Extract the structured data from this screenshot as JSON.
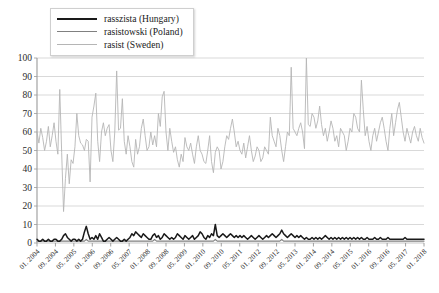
{
  "chart_data": {
    "type": "line",
    "title": "",
    "xlabel": "",
    "ylabel": "",
    "ylim": [
      0,
      100
    ],
    "yticks": [
      0,
      10,
      20,
      30,
      40,
      50,
      60,
      70,
      80,
      90,
      100
    ],
    "ytick_labels": [
      "0",
      "10",
      "20",
      "30",
      "40",
      "50",
      "60",
      "70",
      "80",
      "90",
      "100"
    ],
    "grid": true,
    "legend_position": "top-left",
    "x_tick_labels": [
      "01. 2004",
      "09. 2004",
      "05. 2005",
      "01. 2006",
      "09. 2006",
      "05. 2007",
      "01. 2008",
      "09. 2008",
      "05. 2009",
      "01. 2010",
      "09. 2010",
      "05. 2011",
      "01. 2012",
      "09. 2012",
      "05. 2013",
      "01. 2014",
      "09. 2014",
      "05. 2015",
      "01. 2016",
      "09. 2016",
      "05. 2017",
      "01. 2018"
    ],
    "x_start": "01. 2004",
    "x_end": "01. 2018",
    "series": [
      {
        "name": "rasszista (Hungary)",
        "color": "#1a1a1a",
        "values": [
          2,
          1,
          1,
          2,
          1,
          1,
          2,
          1,
          1,
          2,
          2,
          1,
          1,
          2,
          4,
          5,
          3,
          2,
          1,
          2,
          2,
          1,
          2,
          1,
          2,
          6,
          9,
          5,
          2,
          3,
          2,
          4,
          2,
          5,
          3,
          1,
          1,
          2,
          3,
          2,
          1,
          2,
          3,
          2,
          1,
          1,
          2,
          1,
          2,
          3,
          5,
          4,
          6,
          5,
          4,
          3,
          5,
          4,
          3,
          2,
          2,
          4,
          5,
          3,
          4,
          2,
          3,
          5,
          4,
          3,
          2,
          3,
          2,
          3,
          5,
          4,
          3,
          2,
          4,
          3,
          2,
          3,
          4,
          2,
          3,
          4,
          6,
          5,
          3,
          2,
          4,
          3,
          5,
          4,
          10,
          4,
          3,
          4,
          5,
          4,
          3,
          4,
          5,
          4,
          3,
          4,
          3,
          4,
          3,
          4,
          3,
          2,
          3,
          4,
          3,
          2,
          3,
          4,
          3,
          2,
          3,
          4,
          3,
          4,
          5,
          4,
          3,
          4,
          5,
          7,
          5,
          4,
          3,
          4,
          5,
          4,
          3,
          4,
          3,
          4,
          3,
          2,
          3,
          2,
          2,
          3,
          2,
          3,
          2,
          3,
          2,
          3,
          4,
          3,
          2,
          3,
          2,
          3,
          2,
          3,
          2,
          3,
          2,
          3,
          2,
          3,
          2,
          3,
          2,
          3,
          2,
          3,
          2,
          2,
          3,
          2,
          2,
          2,
          3,
          2,
          2,
          3,
          2,
          2,
          2,
          3,
          2,
          2,
          2,
          2,
          2,
          2,
          2,
          2,
          3,
          2,
          2,
          2,
          2,
          2,
          2,
          2,
          2,
          2,
          2
        ]
      },
      {
        "name": "rasistowski (Poland)",
        "color": "#808080",
        "values": [
          1,
          1,
          1,
          1,
          1,
          1,
          1,
          1,
          1,
          1,
          1,
          1,
          1,
          1,
          1,
          1,
          1,
          1,
          1,
          1,
          1,
          1,
          1,
          1,
          1,
          1,
          2,
          1,
          1,
          1,
          1,
          1,
          1,
          1,
          1,
          1,
          1,
          1,
          1,
          1,
          1,
          1,
          1,
          1,
          1,
          1,
          1,
          1,
          1,
          1,
          1,
          1,
          1,
          1,
          1,
          1,
          1,
          1,
          1,
          1,
          1,
          1,
          2,
          1,
          1,
          1,
          1,
          1,
          1,
          1,
          1,
          1,
          1,
          1,
          1,
          1,
          1,
          1,
          1,
          1,
          1,
          1,
          1,
          1,
          1,
          1,
          1,
          1,
          1,
          1,
          1,
          1,
          1,
          1,
          2,
          1,
          1,
          1,
          1,
          1,
          1,
          1,
          1,
          1,
          1,
          1,
          1,
          1,
          1,
          1,
          1,
          1,
          1,
          1,
          1,
          1,
          1,
          1,
          1,
          1,
          1,
          1,
          1,
          1,
          1,
          1,
          1,
          1,
          1,
          2,
          1,
          1,
          1,
          1,
          1,
          1,
          1,
          1,
          1,
          1,
          1,
          1,
          1,
          1,
          1,
          1,
          1,
          1,
          1,
          1,
          1,
          1,
          1,
          1,
          1,
          1,
          1,
          1,
          1,
          1,
          1,
          1,
          1,
          1,
          1,
          1,
          1,
          1,
          1,
          1,
          1,
          1,
          1,
          1,
          1,
          1,
          1,
          1,
          1,
          1,
          1,
          1,
          1,
          1,
          1,
          1,
          1,
          1,
          1,
          1,
          1,
          1,
          1,
          1,
          1,
          1,
          1,
          1,
          1,
          1,
          1,
          1,
          1,
          1,
          1
        ]
      },
      {
        "name": "rasist (Sweden)",
        "color": "#b5b5b5",
        "values": [
          60,
          54,
          62,
          57,
          50,
          55,
          63,
          52,
          58,
          65,
          55,
          48,
          83,
          49,
          17,
          35,
          48,
          32,
          45,
          43,
          52,
          70,
          58,
          54,
          53,
          50,
          56,
          55,
          33,
          68,
          74,
          81,
          55,
          44,
          60,
          65,
          58,
          62,
          64,
          50,
          44,
          60,
          93,
          61,
          62,
          78,
          55,
          48,
          58,
          52,
          44,
          41,
          56,
          48,
          52,
          62,
          67,
          58,
          50,
          52,
          60,
          53,
          58,
          52,
          70,
          63,
          79,
          82,
          60,
          50,
          62,
          55,
          49,
          52,
          45,
          41,
          48,
          44,
          57,
          52,
          50,
          54,
          48,
          43,
          52,
          58,
          50,
          48,
          44,
          43,
          50,
          58,
          44,
          38,
          49,
          52,
          50,
          40,
          44,
          52,
          58,
          56,
          62,
          67,
          60,
          52,
          55,
          50,
          48,
          54,
          46,
          52,
          58,
          50,
          44,
          47,
          52,
          50,
          44,
          46,
          52,
          50,
          48,
          68,
          58,
          55,
          52,
          62,
          58,
          50,
          44,
          52,
          60,
          58,
          95,
          62,
          60,
          58,
          62,
          65,
          60,
          51,
          100,
          64,
          63,
          70,
          68,
          62,
          66,
          74,
          64,
          58,
          62,
          55,
          60,
          66,
          62,
          55,
          58,
          52,
          62,
          60,
          58,
          50,
          55,
          62,
          60,
          70,
          68,
          62,
          60,
          88,
          72,
          58,
          63,
          55,
          50,
          58,
          62,
          55,
          60,
          65,
          68,
          62,
          55,
          50,
          62,
          70,
          58,
          65,
          72,
          76,
          68,
          60,
          55,
          62,
          58,
          54,
          60,
          63,
          58,
          55,
          62,
          57,
          54
        ]
      }
    ]
  },
  "legend": {
    "items": [
      {
        "label": "rasszista (Hungary)",
        "color": "#1a1a1a",
        "width": "2.2px"
      },
      {
        "label": "rasistowski (Poland)",
        "color": "#808080",
        "width": "1.4px"
      },
      {
        "label": "rasist (Sweden)",
        "color": "#b5b5b5",
        "width": "1.2px"
      }
    ]
  }
}
